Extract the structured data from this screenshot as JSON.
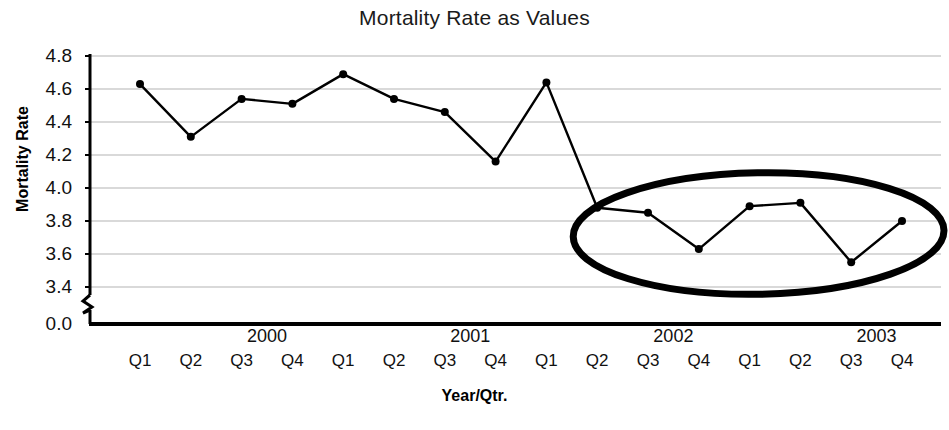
{
  "chart_data": {
    "type": "line",
    "title": "Mortality Rate as Values",
    "xlabel": "Year/Qtr.",
    "ylabel": "Mortality Rate",
    "categories": [
      "Q1",
      "Q2",
      "Q3",
      "Q4",
      "Q1",
      "Q2",
      "Q3",
      "Q4",
      "Q1",
      "Q2",
      "Q3",
      "Q4",
      "Q1",
      "Q2",
      "Q3",
      "Q4"
    ],
    "year_groups": [
      {
        "label": "2000",
        "center_index": 2
      },
      {
        "label": "2001",
        "center_index": 6
      },
      {
        "label": "2002",
        "center_index": 10
      },
      {
        "label": "2003",
        "center_index": 14
      }
    ],
    "values": [
      4.63,
      4.31,
      4.54,
      4.51,
      4.69,
      4.54,
      4.46,
      4.16,
      4.64,
      3.88,
      3.85,
      3.63,
      3.89,
      3.91,
      3.55,
      3.8
    ],
    "ytick_labels": [
      "4.8",
      "4.6",
      "4.4",
      "4.2",
      "4.0",
      "3.8",
      "3.6",
      "3.4",
      "0.0"
    ],
    "ytick_values": [
      4.8,
      4.6,
      4.4,
      4.2,
      4.0,
      3.8,
      3.6,
      3.4,
      0.0
    ],
    "ylim": [
      3.4,
      4.8
    ],
    "axis_break": true,
    "axis_break_label": "0.0",
    "grid": true,
    "grid_axis": "y",
    "legend": false,
    "marker": "filled-circle",
    "line_color": "#000000",
    "marker_color": "#000000",
    "grid_color": "#b3b3b3",
    "axis_color": "#000000",
    "annotations": [
      {
        "type": "ellipse",
        "name": "highlight-ellipse",
        "label": "",
        "covers_indices": [
          9,
          10,
          11,
          12,
          13,
          14,
          15
        ],
        "stroke": "#000000",
        "stroke_width": 7
      }
    ]
  }
}
